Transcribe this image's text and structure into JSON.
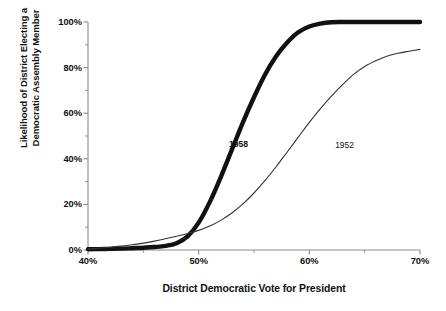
{
  "chart_data": {
    "type": "line",
    "title": "",
    "xlabel": "District Democratic Vote for President",
    "ylabel_line1": "Likelihood of District Electing a",
    "ylabel_line2": "Democratic Assembly Member",
    "xlim": [
      40,
      70
    ],
    "ylim": [
      0,
      100
    ],
    "grid": false,
    "legend": "inline-annotations",
    "x_major_ticks": [
      "40%",
      "50%",
      "60%",
      "70%"
    ],
    "x_major_values": [
      40,
      50,
      60,
      70
    ],
    "x_minor_values": [
      45,
      55,
      65
    ],
    "y_major_ticks": [
      "0%",
      "20%",
      "40%",
      "60%",
      "80%",
      "100%"
    ],
    "y_major_values": [
      0,
      20,
      40,
      60,
      80,
      100
    ],
    "y_minor_values": [
      10,
      30,
      50,
      70,
      90
    ],
    "x": [
      40,
      41,
      42,
      43,
      44,
      45,
      46,
      47,
      48,
      49,
      50,
      51,
      52,
      53,
      54,
      55,
      56,
      57,
      58,
      59,
      60,
      61,
      62,
      63,
      64,
      65,
      66,
      67,
      68,
      69,
      70
    ],
    "series": [
      {
        "name": "1958",
        "style": "thick",
        "color": "#111111",
        "width": 4.4,
        "label_x": 54.0,
        "label_y": 46.0,
        "values": [
          0.3,
          0.4,
          0.5,
          0.6,
          0.8,
          1.0,
          1.3,
          1.8,
          3.0,
          6.0,
          12.0,
          21.0,
          32.0,
          44.0,
          56.0,
          67.0,
          77.0,
          85.0,
          91.0,
          95.5,
          98.0,
          99.3,
          99.9,
          100,
          100,
          100,
          100,
          100,
          100,
          100,
          100
        ]
      },
      {
        "name": "1952",
        "style": "thin",
        "color": "#333333",
        "width": 1.1,
        "label_x": 63.6,
        "label_y": 45.5,
        "values": [
          0.5,
          0.8,
          1.2,
          1.7,
          2.3,
          3.0,
          3.9,
          4.9,
          6.0,
          7.2,
          8.6,
          10.5,
          13.0,
          16.2,
          20.2,
          25.0,
          30.5,
          36.5,
          43.0,
          49.5,
          56.0,
          62.0,
          67.5,
          72.5,
          77.0,
          80.5,
          83.0,
          85.0,
          86.3,
          87.2,
          88.0
        ]
      }
    ]
  },
  "axis": {
    "x_tick_labels": [
      "40%",
      "50%",
      "60%",
      "70%"
    ],
    "y_tick_labels": [
      "100%",
      "80%",
      "60%",
      "40%",
      "20%",
      "0%"
    ]
  },
  "colors": {
    "background": "#ffffff",
    "axis": "#8c8c8c",
    "text": "#111111",
    "series_1958": "#111111",
    "series_1952": "#333333"
  }
}
